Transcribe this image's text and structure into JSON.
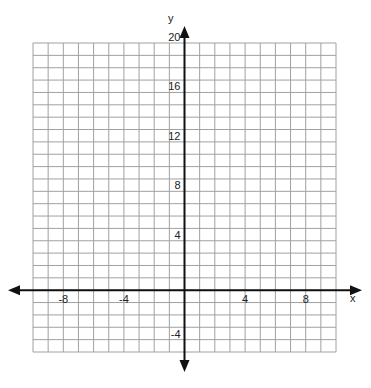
{
  "chart_data": {
    "type": "scatter",
    "title": "",
    "xlabel": "x",
    "ylabel": "y",
    "xlim": [
      -10,
      10
    ],
    "ylim": [
      -5,
      20
    ],
    "grid": true,
    "x_grid_step": 1,
    "y_grid_step": 1,
    "x_ticks": [
      -8,
      -4,
      4,
      8
    ],
    "y_ticks": [
      -4,
      4,
      8,
      12,
      16,
      20
    ],
    "x_tick_labels": [
      "-8",
      "-4",
      "4",
      "8"
    ],
    "y_tick_labels": [
      "-4",
      "4",
      "8",
      "12",
      "16",
      "20"
    ],
    "series": [],
    "axis_arrows": true
  },
  "colors": {
    "grid": "#a0a0a0",
    "axis": "#111111",
    "background": "#ffffff"
  }
}
